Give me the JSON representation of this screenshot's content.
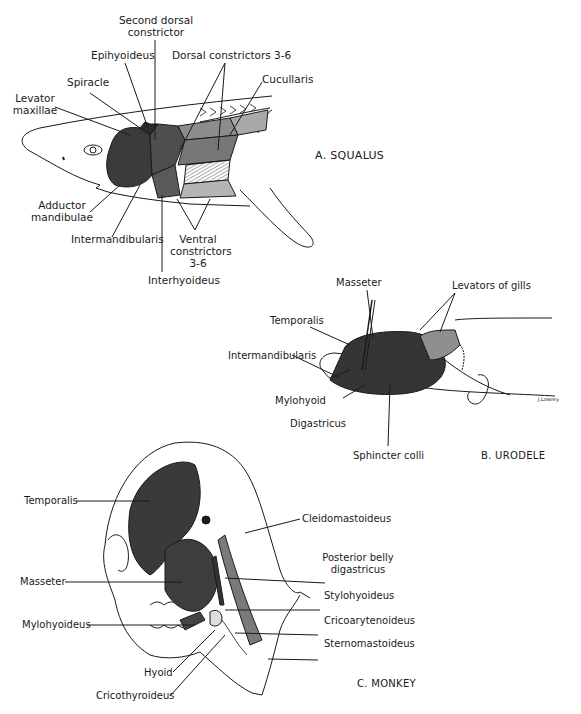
{
  "panels": {
    "squalus": {
      "caption": "A. SQUALUS",
      "labels": {
        "second_dorsal_constrictor_1": "Second dorsal",
        "second_dorsal_constrictor_2": "constrictor",
        "epihyoideus": "Epihyoideus",
        "dorsal_constrictors": "Dorsal constrictors 3-6",
        "cucullaris": "Cucullaris",
        "spiracle": "Spiracle",
        "levator_maxillae_1": "Levator",
        "levator_maxillae_2": "maxillae",
        "adductor_mandibulae_1": "Adductor",
        "adductor_mandibulae_2": "mandibulae",
        "intermandibularis": "Intermandibularis",
        "ventral_constrictors_1": "Ventral",
        "ventral_constrictors_2": "constrictors",
        "ventral_constrictors_3": "3-6",
        "interhyoideus": "Interhyoideus"
      }
    },
    "urodele": {
      "caption": "B. URODELE",
      "labels": {
        "masseter": "Masseter",
        "levators_of_gills": "Levators of gills",
        "temporalis": "Temporalis",
        "intermandibularis": "Intermandibularis",
        "mylohyoid": "Mylohyoid",
        "digastricus": "Digastricus",
        "sphincter_colli": "Sphincter colli"
      },
      "signature": "J.Lowrey"
    },
    "monkey": {
      "caption": "C. MONKEY",
      "labels": {
        "temporalis": "Temporalis",
        "cleidomastoideus": "Cleidomastoideus",
        "posterior_belly_1": "Posterior belly",
        "posterior_belly_2": "digastricus",
        "masseter": "Masseter",
        "stylohyoideus": "Stylohyoideus",
        "cricoarytenoideus": "Cricoarytenoideus",
        "mylohyoideus": "Mylohyoideus",
        "sternomastoideus": "Sternomastoideus",
        "hyoid": "Hyoid",
        "cricothyroideus": "Cricothyroideus"
      }
    }
  },
  "colors": {
    "ink": "#1a1a1a",
    "muscle_dark": "#3a3a3a",
    "muscle_mid": "#6e6e6e",
    "muscle_light": "#a9a9a9",
    "muscle_pale": "#cfcfcf"
  }
}
